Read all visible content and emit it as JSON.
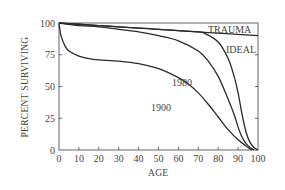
{
  "chart_data": {
    "type": "line",
    "title": "",
    "xlabel": "AGE",
    "ylabel": "PERCENT SURVIVING",
    "xlim": [
      0,
      100
    ],
    "ylim": [
      0,
      100
    ],
    "x_ticks": [
      0,
      10,
      20,
      30,
      40,
      50,
      60,
      70,
      80,
      90,
      100
    ],
    "y_ticks": [
      0,
      25,
      50,
      75,
      100
    ],
    "grid": false,
    "legend": "inline curve labels",
    "series": [
      {
        "name": "TRAUMA",
        "x": [
          0,
          10,
          20,
          30,
          40,
          50,
          60,
          70,
          80,
          90,
          100
        ],
        "y": [
          100,
          99,
          98,
          97,
          96,
          95,
          94,
          93,
          92,
          91,
          90
        ]
      },
      {
        "name": "IDEAL",
        "x": [
          0,
          10,
          20,
          30,
          40,
          50,
          60,
          70,
          73,
          80,
          85,
          88,
          90,
          92,
          94,
          96,
          98,
          100
        ],
        "y": [
          100,
          99,
          98,
          97,
          96,
          95,
          94,
          93,
          92,
          85,
          72,
          58,
          45,
          28,
          14,
          6,
          2,
          0
        ]
      },
      {
        "name": "1980",
        "x": [
          0,
          10,
          20,
          30,
          40,
          50,
          60,
          70,
          75,
          80,
          85,
          88,
          90,
          92,
          94,
          96,
          98
        ],
        "y": [
          100,
          98,
          97,
          95,
          93,
          90,
          86,
          78,
          70,
          58,
          40,
          28,
          18,
          10,
          5,
          2,
          0
        ]
      },
      {
        "name": "1900",
        "x": [
          0,
          1,
          3,
          5,
          10,
          15,
          20,
          30,
          40,
          50,
          60,
          65,
          70,
          75,
          80,
          85,
          90,
          95,
          97
        ],
        "y": [
          100,
          90,
          82,
          78,
          74,
          72,
          71,
          70,
          68,
          64,
          57,
          52,
          45,
          36,
          26,
          16,
          8,
          2,
          0
        ]
      }
    ]
  },
  "labels": {
    "trauma": "TRAUMA",
    "ideal": "IDEAL",
    "y1980": "1980",
    "y1900": "1900",
    "xlabel": "AGE",
    "ylabel": "PERCENT SURVIVING",
    "x_ticks": [
      "0",
      "10",
      "20",
      "30",
      "40",
      "50",
      "60",
      "70",
      "80",
      "90",
      "100"
    ],
    "y_ticks": [
      "0",
      "25",
      "50",
      "75",
      "100"
    ]
  }
}
